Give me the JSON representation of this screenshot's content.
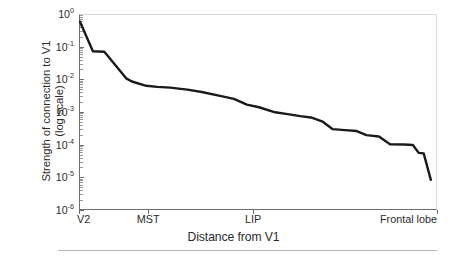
{
  "chart_data": {
    "type": "line",
    "title": "",
    "xlabel": "Distance from V1",
    "ylabel_lines": [
      "Strength of connection to V1",
      "(log scale)"
    ],
    "yscale": "log",
    "ylim": [
      1e-06,
      1
    ],
    "ytick_values": [
      1,
      0.1,
      0.01,
      0.001,
      0.0001,
      1e-05,
      1e-06
    ],
    "ytick_labels": [
      "10",
      "10",
      "10",
      "10",
      "10",
      "10",
      "10"
    ],
    "ytick_exponents": [
      "0",
      "-1",
      "-2",
      "-3",
      "-4",
      "-5",
      "-6"
    ],
    "xtick_labels": [
      "V2",
      "MST",
      "LIP",
      "Frontal lobe"
    ],
    "xtick_positions": [
      0,
      0.193,
      0.486,
      1.0
    ],
    "grid": false,
    "legend": "none",
    "line_color": "#1a1a1a",
    "line_width": 2.4,
    "series": [
      {
        "name": "Strength of connection to V1",
        "points": [
          [
            0.0,
            0.62
          ],
          [
            0.036,
            0.078
          ],
          [
            0.068,
            0.075
          ],
          [
            0.129,
            0.0115
          ],
          [
            0.145,
            0.0092
          ],
          [
            0.185,
            0.0068
          ],
          [
            0.216,
            0.0063
          ],
          [
            0.252,
            0.006
          ],
          [
            0.3,
            0.0052
          ],
          [
            0.34,
            0.0044
          ],
          [
            0.388,
            0.0034
          ],
          [
            0.43,
            0.0027
          ],
          [
            0.466,
            0.0018
          ],
          [
            0.5,
            0.0015
          ],
          [
            0.545,
            0.00105
          ],
          [
            0.58,
            0.00092
          ],
          [
            0.615,
            0.0008
          ],
          [
            0.645,
            0.00073
          ],
          [
            0.678,
            0.00054
          ],
          [
            0.706,
            0.00032
          ],
          [
            0.74,
            0.0003
          ],
          [
            0.773,
            0.00028
          ],
          [
            0.8,
            0.00021
          ],
          [
            0.835,
            0.00019
          ],
          [
            0.866,
            0.00011
          ],
          [
            0.905,
            0.000108
          ],
          [
            0.93,
            0.000105
          ],
          [
            0.946,
            6e-05
          ],
          [
            0.96,
            5.8e-05
          ],
          [
            0.98,
            9e-06
          ]
        ]
      }
    ]
  },
  "axis": {
    "x_title": "Distance from V1",
    "y_title_line1": "Strength of connection to V1",
    "y_title_line2": "(log scale)"
  }
}
